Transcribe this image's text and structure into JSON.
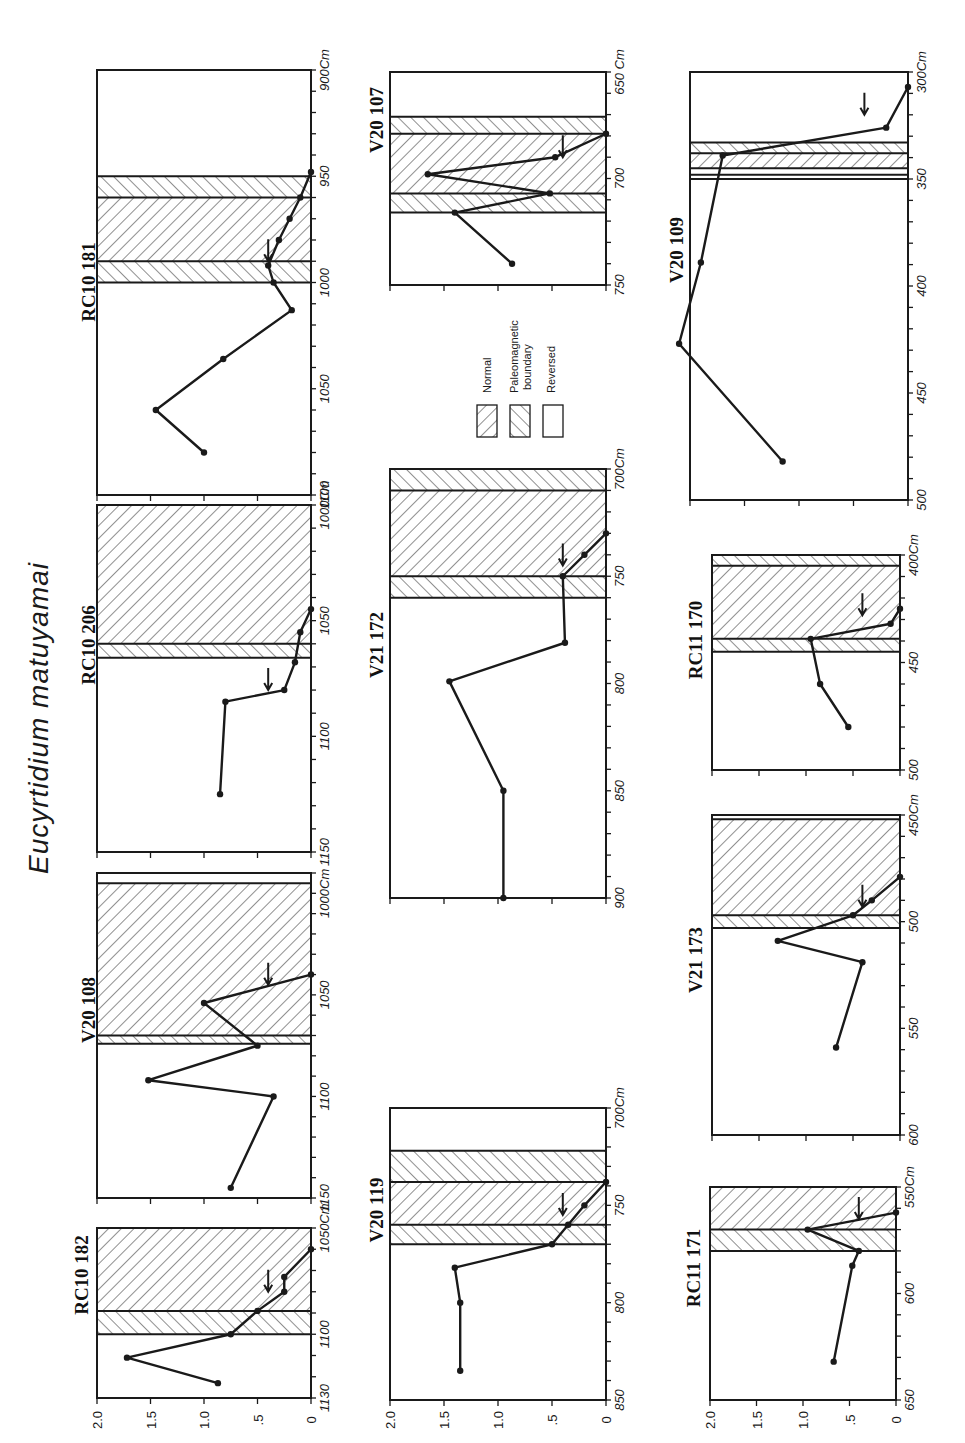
{
  "title": "Eucyrtidium matuyamai",
  "legend": [
    {
      "key": "normal",
      "label": "Normal",
      "pattern": "hatch-normal"
    },
    {
      "key": "boundary",
      "label": "Paleomagnetic boundary",
      "label_lines": [
        "Paleomagnetic",
        "boundary"
      ],
      "pattern": "hatch-boundary"
    },
    {
      "key": "reversed",
      "label": "Reversed",
      "pattern": "none"
    }
  ],
  "value_axis": {
    "ticks": [
      2.0,
      1.5,
      1.0,
      0.5,
      0.0
    ],
    "tick_labels": [
      "2.0",
      "1.5",
      "1.0",
      ".5",
      "0"
    ]
  },
  "chart_data": [
    {
      "type": "line",
      "core": "RC10 181",
      "ylabel": "Depth (cm)",
      "xlabel": "Value",
      "depth_range": [
        900,
        1100
      ],
      "depth_unit": "Cm",
      "depth_ticks": [
        900,
        950,
        1000,
        1050,
        1100
      ],
      "depth_tick_labels": [
        "900Cm",
        "950",
        "1000",
        "1050",
        "1100"
      ],
      "value_range": [
        0,
        2.0
      ],
      "zones": [
        {
          "from": 900,
          "to": 950,
          "type": "reversed"
        },
        {
          "from": 950,
          "to": 960,
          "type": "boundary"
        },
        {
          "from": 960,
          "to": 990,
          "type": "normal"
        },
        {
          "from": 990,
          "to": 1000,
          "type": "boundary"
        },
        {
          "from": 1000,
          "to": 1100,
          "type": "reversed"
        }
      ],
      "points": [
        [
          948,
          0.0
        ],
        [
          960,
          0.1
        ],
        [
          970,
          0.2
        ],
        [
          980,
          0.3
        ],
        [
          992,
          0.4
        ],
        [
          1000,
          0.35
        ],
        [
          1013,
          0.18
        ],
        [
          1036,
          0.82
        ],
        [
          1060,
          1.45
        ],
        [
          1080,
          1.0
        ]
      ],
      "arrow_at": 990
    },
    {
      "type": "line",
      "core": "RC10 206",
      "ylabel": "Depth (cm)",
      "xlabel": "Value",
      "depth_range": [
        1000,
        1150
      ],
      "depth_unit": "Cm",
      "depth_ticks": [
        1000,
        1050,
        1100,
        1150
      ],
      "depth_tick_labels": [
        "1000Cm",
        "1050",
        "1100",
        "1150"
      ],
      "value_range": [
        0,
        2.0
      ],
      "zones": [
        {
          "from": 1000,
          "to": 1060,
          "type": "normal"
        },
        {
          "from": 1060,
          "to": 1066,
          "type": "boundary"
        },
        {
          "from": 1066,
          "to": 1150,
          "type": "reversed"
        }
      ],
      "points": [
        [
          1045,
          0.0
        ],
        [
          1055,
          0.1
        ],
        [
          1068,
          0.15
        ],
        [
          1080,
          0.25
        ],
        [
          1085,
          0.8
        ],
        [
          1125,
          0.85
        ]
      ],
      "arrow_at": 1080
    },
    {
      "type": "line",
      "core": "V20 108",
      "ylabel": "Depth (cm)",
      "xlabel": "Value",
      "depth_range": [
        990,
        1150
      ],
      "depth_unit": "Cm",
      "depth_ticks": [
        1000,
        1050,
        1100,
        1150
      ],
      "depth_tick_labels": [
        "1000Cm",
        "1050",
        "1100",
        "1150"
      ],
      "value_range": [
        0,
        2.0
      ],
      "zones": [
        {
          "from": 990,
          "to": 995,
          "type": "reversed"
        },
        {
          "from": 995,
          "to": 1070,
          "type": "normal"
        },
        {
          "from": 1070,
          "to": 1074,
          "type": "boundary"
        },
        {
          "from": 1074,
          "to": 1150,
          "type": "reversed"
        }
      ],
      "points": [
        [
          1040,
          0.0
        ],
        [
          1054,
          1.0
        ],
        [
          1075,
          0.5
        ],
        [
          1092,
          1.52
        ],
        [
          1100,
          0.35
        ],
        [
          1145,
          0.75
        ]
      ],
      "arrow_at": 1045
    },
    {
      "type": "line",
      "core": "RC10 182",
      "ylabel": "Depth (cm)",
      "xlabel": "Value",
      "depth_range": [
        1050,
        1130
      ],
      "depth_unit": "Cm",
      "depth_ticks": [
        1050,
        1100,
        1130
      ],
      "depth_tick_labels": [
        "1050Cm",
        "1100",
        "1130"
      ],
      "value_range": [
        0,
        2.0
      ],
      "zones": [
        {
          "from": 1050,
          "to": 1089,
          "type": "normal"
        },
        {
          "from": 1089,
          "to": 1100,
          "type": "boundary"
        },
        {
          "from": 1100,
          "to": 1130,
          "type": "reversed"
        }
      ],
      "points": [
        [
          1060,
          0.0
        ],
        [
          1073,
          0.25
        ],
        [
          1080,
          0.25
        ],
        [
          1089,
          0.5
        ],
        [
          1100,
          0.75
        ],
        [
          1111,
          1.72
        ],
        [
          1123,
          0.87
        ]
      ],
      "arrow_at": 1080
    },
    {
      "type": "line",
      "core": "V20 107",
      "ylabel": "Depth (cm)",
      "xlabel": "Value",
      "depth_range": [
        650,
        750
      ],
      "depth_unit": "Cm",
      "depth_ticks": [
        650,
        700,
        750
      ],
      "depth_tick_labels": [
        "650 Cm",
        "700",
        "750"
      ],
      "value_range": [
        0,
        2.0
      ],
      "zones": [
        {
          "from": 650,
          "to": 671,
          "type": "reversed"
        },
        {
          "from": 671,
          "to": 679,
          "type": "boundary"
        },
        {
          "from": 679,
          "to": 707,
          "type": "normal"
        },
        {
          "from": 707,
          "to": 716,
          "type": "boundary"
        },
        {
          "from": 716,
          "to": 750,
          "type": "reversed"
        }
      ],
      "points": [
        [
          679,
          0.0
        ],
        [
          690,
          0.47
        ],
        [
          698,
          1.65
        ],
        [
          707,
          0.52
        ],
        [
          716,
          1.4
        ],
        [
          740,
          0.87
        ]
      ],
      "arrow_at": 690
    },
    {
      "type": "line",
      "core": "V21 172",
      "ylabel": "Depth (cm)",
      "xlabel": "Value",
      "depth_range": [
        700,
        900
      ],
      "depth_unit": "Cm",
      "depth_ticks": [
        700,
        750,
        800,
        850,
        900
      ],
      "depth_tick_labels": [
        "700Cm",
        "750",
        "800",
        "850",
        "900"
      ],
      "value_range": [
        0,
        2.0
      ],
      "zones": [
        {
          "from": 700,
          "to": 710,
          "type": "boundary"
        },
        {
          "from": 710,
          "to": 750,
          "type": "normal"
        },
        {
          "from": 750,
          "to": 760,
          "type": "boundary"
        },
        {
          "from": 760,
          "to": 900,
          "type": "reversed"
        }
      ],
      "points": [
        [
          730,
          0.0
        ],
        [
          740,
          0.2
        ],
        [
          750,
          0.4
        ],
        [
          781,
          0.38
        ],
        [
          799,
          1.45
        ],
        [
          850,
          0.95
        ],
        [
          900,
          0.95
        ]
      ],
      "arrow_at": 745
    },
    {
      "type": "line",
      "core": "V20 109",
      "ylabel": "Depth (cm)",
      "xlabel": "Value",
      "depth_range": [
        300,
        500
      ],
      "depth_unit": "Cm",
      "depth_ticks": [
        300,
        350,
        400,
        450,
        500
      ],
      "depth_tick_labels": [
        "300Cm",
        "350",
        "400",
        "450",
        "500"
      ],
      "value_range": [
        0,
        2.0
      ],
      "zones": [
        {
          "from": 300,
          "to": 333,
          "type": "reversed"
        },
        {
          "from": 333,
          "to": 338,
          "type": "boundary"
        },
        {
          "from": 338,
          "to": 345,
          "type": "normal"
        },
        {
          "from": 345,
          "to": 348,
          "type": "reversed"
        },
        {
          "from": 348,
          "to": 350,
          "type": "reversed"
        },
        {
          "from": 350,
          "to": 500,
          "type": "reversed"
        }
      ],
      "points": [
        [
          307,
          0.0
        ],
        [
          326,
          0.2
        ],
        [
          339,
          1.7
        ],
        [
          389,
          1.9
        ],
        [
          427,
          2.1
        ],
        [
          482,
          1.15
        ]
      ],
      "arrow_at": 320
    },
    {
      "type": "line",
      "core": "RC11 170",
      "ylabel": "Depth (cm)",
      "xlabel": "Value",
      "depth_range": [
        400,
        500
      ],
      "depth_unit": "Cm",
      "depth_ticks": [
        400,
        450,
        500
      ],
      "depth_tick_labels": [
        "400Cm",
        "450",
        "500"
      ],
      "value_range": [
        0,
        2.0
      ],
      "zones": [
        {
          "from": 400,
          "to": 405,
          "type": "boundary"
        },
        {
          "from": 405,
          "to": 439,
          "type": "normal"
        },
        {
          "from": 439,
          "to": 445,
          "type": "boundary"
        },
        {
          "from": 445,
          "to": 500,
          "type": "reversed"
        }
      ],
      "points": [
        [
          425,
          0.0
        ],
        [
          432,
          0.1
        ],
        [
          439,
          0.95
        ],
        [
          460,
          0.85
        ],
        [
          480,
          0.55
        ]
      ],
      "arrow_at": 428
    },
    {
      "type": "line",
      "core": "V21 173",
      "ylabel": "Depth (cm)",
      "xlabel": "Value",
      "depth_range": [
        450,
        600
      ],
      "depth_unit": "Cm",
      "depth_ticks": [
        450,
        500,
        550,
        600
      ],
      "depth_tick_labels": [
        "450Cm",
        "500",
        "550",
        "600"
      ],
      "value_range": [
        0,
        2.0
      ],
      "zones": [
        {
          "from": 450,
          "to": 452,
          "type": "reversed"
        },
        {
          "from": 452,
          "to": 497,
          "type": "normal"
        },
        {
          "from": 497,
          "to": 503,
          "type": "boundary"
        },
        {
          "from": 503,
          "to": 600,
          "type": "reversed"
        }
      ],
      "points": [
        [
          479,
          0.0
        ],
        [
          490,
          0.3
        ],
        [
          497,
          0.5
        ],
        [
          509,
          1.3
        ],
        [
          519,
          0.4
        ],
        [
          559,
          0.68
        ]
      ],
      "arrow_at": 493
    },
    {
      "type": "line",
      "core": "RC11 171",
      "ylabel": "Depth (cm)",
      "xlabel": "Value",
      "depth_range": [
        550,
        650
      ],
      "depth_unit": "Cm",
      "depth_ticks": [
        550,
        600,
        650
      ],
      "depth_tick_labels": [
        "550Cm",
        "600",
        "650"
      ],
      "value_range": [
        0,
        2.0
      ],
      "zones": [
        {
          "from": 550,
          "to": 570,
          "type": "normal"
        },
        {
          "from": 570,
          "to": 580,
          "type": "boundary"
        },
        {
          "from": 580,
          "to": 650,
          "type": "reversed"
        }
      ],
      "points": [
        [
          562,
          0.0
        ],
        [
          570,
          0.95
        ],
        [
          580,
          0.4
        ],
        [
          587,
          0.47
        ],
        [
          632,
          0.67
        ]
      ],
      "arrow_at": 565
    }
  ]
}
